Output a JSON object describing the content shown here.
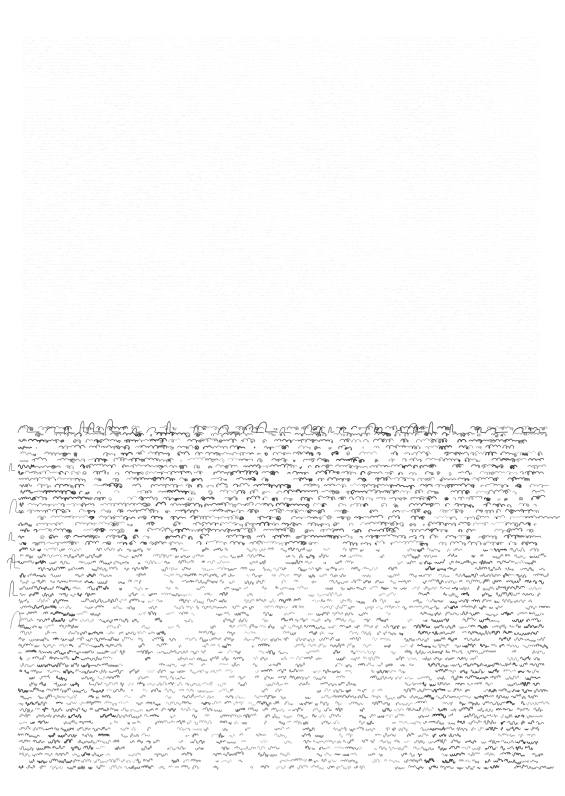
{
  "document": {
    "title": "Asemic Writing Plate",
    "background_color": "#ffffff",
    "width": 565,
    "height": 796,
    "medium": "ink on paper",
    "content_kind": "asemic-script-field"
  },
  "panels": [
    {
      "id": "upper-plate",
      "name": "upper-faint-plate",
      "label": "",
      "x": 25,
      "y": 36,
      "width": 512,
      "height": 361,
      "ink_color": "#b9b9b9",
      "ink_opacity": 0.3,
      "background_color": "#ffffff",
      "stroke_scale": 0.42,
      "line_height": 3.1,
      "density": 1.0,
      "style": "vertical-striation-grid",
      "block_grid": {
        "columns": [
          0.0,
          0.13,
          0.21,
          0.34,
          0.42,
          0.55,
          0.62,
          0.71,
          0.83,
          0.91,
          1.0
        ],
        "rows": [
          0.0,
          0.11,
          0.22,
          0.3,
          0.41,
          0.52,
          0.62,
          0.7,
          0.79,
          0.88,
          1.0
        ],
        "tone_min": 0.55,
        "tone_max": 1.0
      },
      "overflow_loops": false
    },
    {
      "id": "lower-plate",
      "name": "lower-dark-plate",
      "label": "",
      "x": 22,
      "y": 424,
      "width": 518,
      "height": 348,
      "ink_color": "#2b2b2b",
      "ink_opacity": 0.92,
      "background_color": "#ffffff",
      "stroke_scale": 1.0,
      "line_height": 6.4,
      "density": 1.0,
      "style": "cursive-scribble-field",
      "overflow_loops": true,
      "top_flourish_band": {
        "height": 16,
        "amplitude": 13,
        "description": "long looping ascenders rising above the block"
      },
      "inner_regions": [
        {
          "name": "inner-light-rectangle",
          "x": 105,
          "y": 546,
          "width": 310,
          "height": 222,
          "relative_density": 0.74,
          "stroke_tilt": 82,
          "tone": "lighter, near-vertical strokes"
        },
        {
          "name": "inner-divider-column",
          "x": 265,
          "y": 546,
          "width": 1,
          "height": 222,
          "relative_density": 1.0,
          "tone": "faint vertical seam"
        },
        {
          "name": "upper-band",
          "x": 22,
          "y": 424,
          "width": 518,
          "height": 122,
          "relative_density": 1.0,
          "stroke_tilt": 28,
          "tone": "dense diagonal strokes"
        }
      ]
    }
  ],
  "colors": {
    "paper": "#ffffff",
    "ink_dark": "#2b2b2b",
    "ink_faint": "#b9b9b9",
    "seam": "#d8d8d8"
  }
}
